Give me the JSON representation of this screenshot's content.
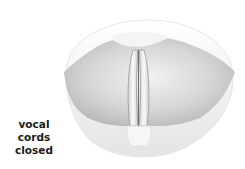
{
  "figure": {
    "label_line1": "vocal cords",
    "label_line2": "closed",
    "colors": {
      "background": "#ffffff",
      "tissue_light": "#f4f4f4",
      "tissue_mid": "#d8d8d8",
      "tissue_dark": "#a8a8a8",
      "fold_line": "#6e6e6e",
      "text": "#1a1a1a"
    }
  }
}
